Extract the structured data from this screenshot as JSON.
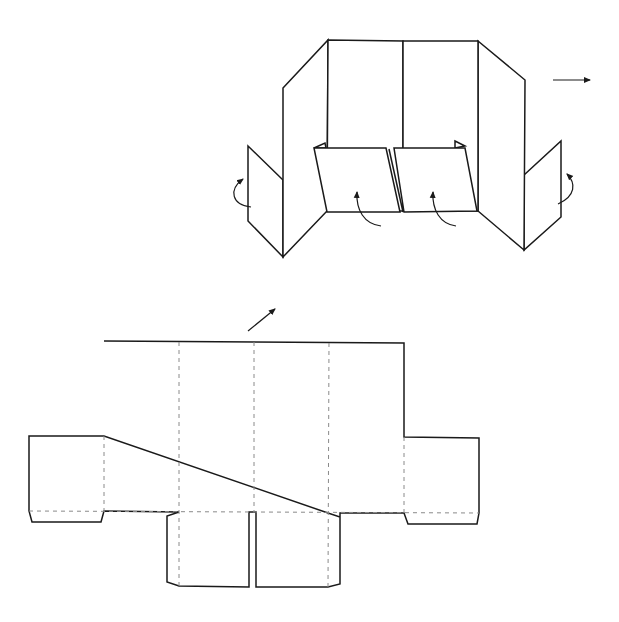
{
  "figure": {
    "colors": {
      "line": "#1a1a1a",
      "fold_line": "#8a8a8a",
      "background": "#ffffff"
    },
    "folded_view": {
      "panels": [
        "left-side-panel",
        "back-panel-left",
        "back-panel-right",
        "right-side-panel"
      ],
      "flaps": [
        "left-side-flap",
        "front-flap-left",
        "front-flap-right",
        "right-side-flap"
      ],
      "fold_directions": {
        "left-side-flap": "fold inward (curved arrow)",
        "front-flap-left": "fold up (curved arrow)",
        "front-flap-right": "fold up (curved arrow)",
        "right-side-flap": "fold inward (curved arrow)"
      },
      "direction_arrow": "right"
    },
    "flat_net": {
      "main_panels": 4,
      "vertical_fold_lines": 3,
      "side_tabs": [
        "left-side-tab",
        "right-side-tab"
      ],
      "bottom_flaps": [
        "bottom-flap-left",
        "bottom-flap-right"
      ],
      "glue_tabs": [
        "left-glue-tab",
        "right-glue-tab"
      ],
      "direction_arrow": "up-right"
    }
  }
}
